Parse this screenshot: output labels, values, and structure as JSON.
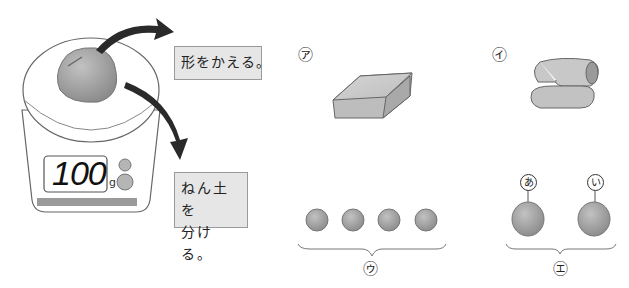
{
  "scale": {
    "display_value": "100",
    "unit": "g"
  },
  "actions": {
    "change_shape": "形をかえる。",
    "split_clay_line1": "ねん土を",
    "split_clay_line2": "分ける。"
  },
  "options": [
    {
      "label": "㋐",
      "description": "flattened block of clay"
    },
    {
      "label": "㋑",
      "description": "rolled and folded clay rope"
    },
    {
      "label": "㋒",
      "description": "clay split into four small balls"
    },
    {
      "label": "㋓",
      "description": "clay split into two balls",
      "sub_labels": [
        "あ",
        "い"
      ]
    }
  ],
  "colors": {
    "clay": "#9e9e9e",
    "label_bg": "#e6e6e6",
    "arrow": "#2a2a2a"
  }
}
